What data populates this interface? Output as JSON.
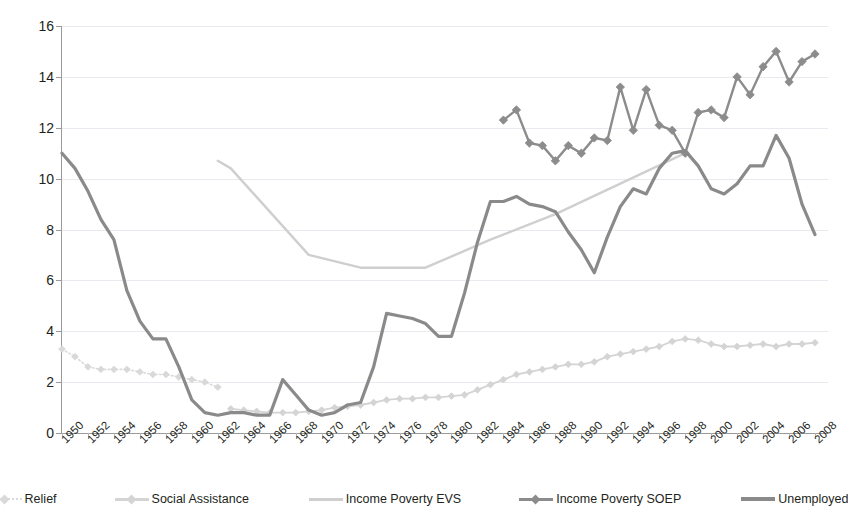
{
  "chart_data": {
    "type": "line",
    "title": "",
    "xlabel": "",
    "ylabel": "",
    "ylim": [
      0,
      16
    ],
    "yticks": [
      0,
      2,
      4,
      6,
      8,
      10,
      12,
      14,
      16
    ],
    "grid": true,
    "legend_position": "bottom",
    "xlim": [
      1950,
      2009
    ],
    "xticks": [
      1950,
      1952,
      1954,
      1956,
      1958,
      1960,
      1962,
      1964,
      1966,
      1968,
      1970,
      1972,
      1974,
      1976,
      1978,
      1980,
      1982,
      1984,
      1986,
      1988,
      1990,
      1992,
      1994,
      1996,
      1998,
      2000,
      2002,
      2004,
      2006,
      2008
    ],
    "xtick_labels": [
      "1950",
      "1952",
      "1954",
      "1956",
      "1958",
      "1960",
      "1962",
      "1964",
      "1966",
      "1968",
      "1970",
      "1972",
      "1974",
      "1976",
      "1978",
      "1980",
      "1982",
      "1984",
      "1986",
      "1988",
      "1990",
      "1992",
      "1994",
      "1996",
      "1998",
      "2000",
      "2002",
      "2004",
      "2006",
      "2008"
    ],
    "series": [
      {
        "name": "Relief",
        "color": "#d9d9d9",
        "style": "dotted-markers",
        "x": [
          1950,
          1951,
          1952,
          1953,
          1954,
          1955,
          1956,
          1957,
          1958,
          1959,
          1960,
          1961,
          1962
        ],
        "values": [
          3.3,
          3.0,
          2.6,
          2.5,
          2.5,
          2.5,
          2.4,
          2.3,
          2.3,
          2.2,
          2.1,
          2.0,
          1.8
        ]
      },
      {
        "name": "Social Assistance",
        "color": "#d4d4d4",
        "style": "line-markers",
        "x": [
          1963,
          1964,
          1965,
          1966,
          1967,
          1968,
          1969,
          1970,
          1971,
          1972,
          1973,
          1974,
          1975,
          1976,
          1977,
          1978,
          1979,
          1980,
          1981,
          1982,
          1983,
          1984,
          1985,
          1986,
          1987,
          1988,
          1989,
          1990,
          1991,
          1992,
          1993,
          1994,
          1995,
          1996,
          1997,
          1998,
          1999,
          2000,
          2001,
          2002,
          2003,
          2004,
          2005,
          2006,
          2007,
          2008
        ],
        "values": [
          0.95,
          0.9,
          0.85,
          0.8,
          0.8,
          0.8,
          0.85,
          0.9,
          1.0,
          1.05,
          1.1,
          1.2,
          1.3,
          1.35,
          1.35,
          1.4,
          1.4,
          1.45,
          1.5,
          1.7,
          1.9,
          2.1,
          2.3,
          2.4,
          2.5,
          2.6,
          2.7,
          2.7,
          2.8,
          3.0,
          3.1,
          3.2,
          3.3,
          3.4,
          3.6,
          3.7,
          3.65,
          3.5,
          3.4,
          3.4,
          3.45,
          3.5,
          3.4,
          3.5,
          3.5,
          3.55
        ]
      },
      {
        "name": "Income Poverty EVS",
        "color": "#cfcfcf",
        "style": "line",
        "x": [
          1962,
          1963,
          1969,
          1973,
          1978,
          1983,
          1988,
          1993,
          1998
        ],
        "values": [
          10.7,
          10.4,
          7.0,
          6.5,
          6.5,
          7.6,
          8.6,
          9.8,
          11.0
        ]
      },
      {
        "name": "Income Poverty SOEP",
        "color": "#8c8c8c",
        "style": "line-diamond",
        "x": [
          1984,
          1985,
          1986,
          1987,
          1988,
          1989,
          1990,
          1991,
          1992,
          1993,
          1994,
          1995,
          1996,
          1997,
          1998,
          1999,
          2000,
          2001,
          2002,
          2003,
          2004,
          2005,
          2006,
          2007,
          2008
        ],
        "values": [
          12.3,
          12.7,
          11.4,
          11.3,
          10.7,
          11.3,
          11.0,
          11.6,
          11.5,
          13.6,
          11.9,
          13.5,
          12.1,
          11.9,
          11.0,
          12.6,
          12.7,
          12.4,
          14.0,
          13.3,
          14.4,
          15.0,
          13.8,
          14.6,
          14.9
        ]
      },
      {
        "name": "Unemployed",
        "color": "#8a8a8a",
        "style": "line-thick",
        "x": [
          1950,
          1951,
          1952,
          1953,
          1954,
          1955,
          1956,
          1957,
          1958,
          1959,
          1960,
          1961,
          1962,
          1963,
          1964,
          1965,
          1966,
          1967,
          1968,
          1969,
          1970,
          1971,
          1972,
          1973,
          1974,
          1975,
          1976,
          1977,
          1978,
          1979,
          1980,
          1981,
          1982,
          1983,
          1984,
          1985,
          1986,
          1987,
          1988,
          1989,
          1990,
          1991,
          1992,
          1993,
          1994,
          1995,
          1996,
          1997,
          1998,
          1999,
          2000,
          2001,
          2002,
          2003,
          2004,
          2005,
          2006,
          2007,
          2008
        ],
        "values": [
          11.0,
          10.4,
          9.5,
          8.4,
          7.6,
          5.6,
          4.4,
          3.7,
          3.7,
          2.6,
          1.3,
          0.8,
          0.7,
          0.8,
          0.8,
          0.7,
          0.7,
          2.1,
          1.5,
          0.9,
          0.7,
          0.8,
          1.1,
          1.2,
          2.6,
          4.7,
          4.6,
          4.5,
          4.3,
          3.8,
          3.8,
          5.5,
          7.5,
          9.1,
          9.1,
          9.3,
          9.0,
          8.9,
          8.7,
          7.9,
          7.2,
          6.3,
          7.7,
          8.9,
          9.6,
          9.4,
          10.4,
          11.0,
          11.1,
          10.5,
          9.6,
          9.4,
          9.8,
          10.5,
          10.5,
          11.7,
          10.8,
          9.0,
          7.8
        ]
      }
    ]
  },
  "legend": {
    "items": [
      {
        "label": "Relief",
        "marker": "dotted-diamond"
      },
      {
        "label": "Social Assistance",
        "marker": "line-diamond"
      },
      {
        "label": "Income Poverty EVS",
        "marker": "line"
      },
      {
        "label": "Income Poverty SOEP",
        "marker": "line-diamond"
      },
      {
        "label": "Unemployed",
        "marker": "thick-line"
      }
    ]
  },
  "axis": {
    "y_labels": [
      "16",
      "14",
      "12",
      "10",
      "8",
      "6",
      "4",
      "2",
      "0"
    ]
  }
}
